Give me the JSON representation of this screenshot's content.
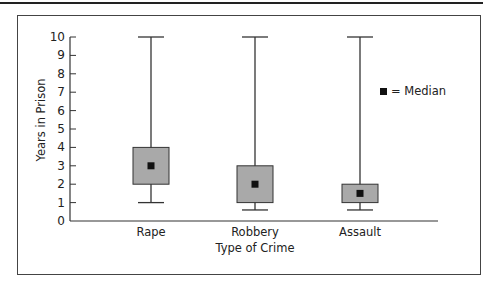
{
  "chart_data": {
    "type": "boxplot",
    "title": "",
    "xlabel": "Type of Crime",
    "ylabel": "Years in Prison",
    "ylim": [
      0,
      10
    ],
    "yticks": [
      0,
      1,
      2,
      3,
      4,
      5,
      6,
      7,
      8,
      9,
      10
    ],
    "grid": false,
    "legend": {
      "position": "upper right",
      "entries": [
        {
          "symbol": "■",
          "label": "= Median"
        }
      ]
    },
    "categories": [
      "Rape",
      "Robbery",
      "Assault"
    ],
    "series": [
      {
        "name": "Rape",
        "min": 1.0,
        "q1": 2.0,
        "median": 3.0,
        "q3": 4.0,
        "max": 10.0
      },
      {
        "name": "Robbery",
        "min": 0.6,
        "q1": 1.0,
        "median": 2.0,
        "q3": 3.0,
        "max": 10.0
      },
      {
        "name": "Assault",
        "min": 0.6,
        "q1": 1.0,
        "median": 1.5,
        "q3": 2.0,
        "max": 10.0
      }
    ],
    "colors": {
      "box_fill": "#a9a9a9",
      "box_stroke": "#333333",
      "median_marker": "#111111",
      "axis": "#333333"
    }
  }
}
